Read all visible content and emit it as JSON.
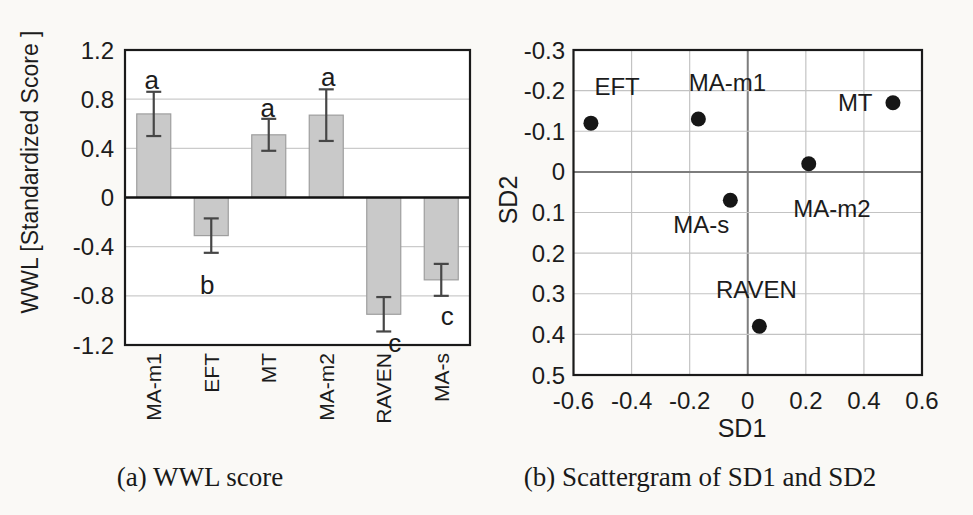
{
  "page": {
    "background": "#faf9f6"
  },
  "chart_data": [
    {
      "type": "bar",
      "caption": "(a) WWL score",
      "ylabel": "WWL [Standardized Score ]",
      "ylim": [
        -1.2,
        1.2
      ],
      "ytick_labels": [
        "1.2",
        "0.8",
        "0.4",
        "0",
        "-0.4",
        "-0.8",
        "-1.2"
      ],
      "ytick_values": [
        1.2,
        0.8,
        0.4,
        0,
        -0.4,
        -0.8,
        -1.2
      ],
      "grid_values": [
        0.8,
        0.4,
        -0.4,
        -0.8
      ],
      "categories": [
        "MA-m1",
        "EFT",
        "MT",
        "MA-m2",
        "RAVEN",
        "MA-s"
      ],
      "values": [
        0.68,
        -0.31,
        0.51,
        0.67,
        -0.95,
        -0.67
      ],
      "errors": [
        0.18,
        0.14,
        0.13,
        0.21,
        0.14,
        0.13
      ],
      "sig_letters": [
        {
          "letter": "a",
          "at": 0.96,
          "dx": -2
        },
        {
          "letter": "b",
          "at": -0.71,
          "dx": -4
        },
        {
          "letter": "a",
          "at": 0.73,
          "dx": -1
        },
        {
          "letter": "a",
          "at": 0.98,
          "dx": 2
        },
        {
          "letter": "c",
          "at": -1.18,
          "dx": 11
        },
        {
          "letter": "c",
          "at": -0.96,
          "dx": 6
        }
      ],
      "bar_color": "#c9c9c9",
      "bar_border_color": "#9e9e9e",
      "error_color": "#464646",
      "grid_color": "#cbcbcb",
      "axis_color": "#1a1a1a",
      "plot_bg": "#ffffff"
    },
    {
      "type": "scatter",
      "caption": "(b) Scattergram of SD1 and SD2",
      "xlabel": "SD1",
      "ylabel": "SD2",
      "xlim": [
        -0.6,
        0.6
      ],
      "ylim": [
        -0.3,
        0.5
      ],
      "y_axis_inverted": true,
      "xtick_labels": [
        "-0.6",
        "-0.4",
        "-0.2",
        "0",
        "0.2",
        "0.4",
        "0.6"
      ],
      "xtick_values": [
        -0.6,
        -0.4,
        -0.2,
        0,
        0.2,
        0.4,
        0.6
      ],
      "ytick_labels": [
        "-0.3",
        "-0.2",
        "-0.1",
        "0",
        "0.1",
        "0.2",
        "0.3",
        "0.4",
        "0.5"
      ],
      "ytick_values": [
        -0.3,
        -0.2,
        -0.1,
        0,
        0.1,
        0.2,
        0.3,
        0.4,
        0.5
      ],
      "points": [
        {
          "label": "EFT",
          "x": -0.54,
          "y": -0.12,
          "label_x": -0.45,
          "label_y": -0.21
        },
        {
          "label": "MA-m1",
          "x": -0.17,
          "y": -0.13,
          "label_x": -0.07,
          "label_y": -0.22
        },
        {
          "label": "MT",
          "x": 0.5,
          "y": -0.17,
          "label_x": 0.37,
          "label_y": -0.17
        },
        {
          "label": "MA-m2",
          "x": 0.21,
          "y": -0.02,
          "label_x": 0.29,
          "label_y": 0.09
        },
        {
          "label": "MA-s",
          "x": -0.06,
          "y": 0.07,
          "label_x": -0.16,
          "label_y": 0.13
        },
        {
          "label": "RAVEN",
          "x": 0.04,
          "y": 0.38,
          "label_x": 0.03,
          "label_y": 0.29
        }
      ],
      "point_color": "#161616",
      "grid_color": "#c3c3c3",
      "zero_line_color": "#7d7d7d",
      "axis_color": "#1a1a1a",
      "plot_bg": "#ffffff"
    }
  ]
}
